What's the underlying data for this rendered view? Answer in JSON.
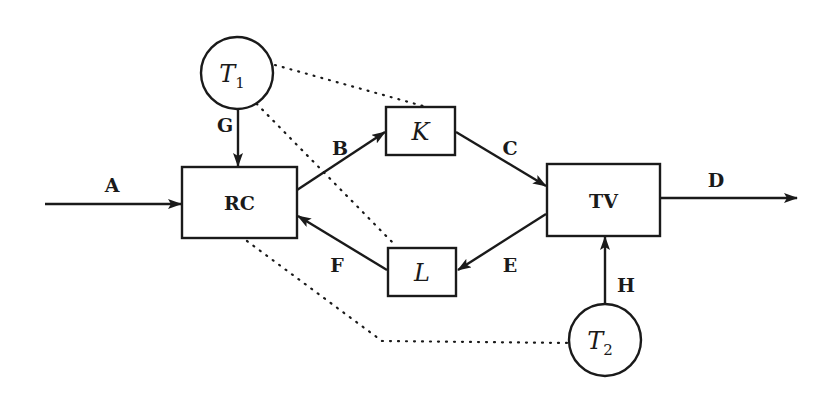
{
  "diagram": {
    "colors": {
      "stroke": "#1a1a1a",
      "background": "#ffffff"
    },
    "nodes": {
      "RC": {
        "label": "RC",
        "shape": "rectangle"
      },
      "TV": {
        "label": "TV",
        "shape": "rectangle"
      },
      "K": {
        "label": "K",
        "shape": "rectangle"
      },
      "L": {
        "label": "L",
        "shape": "rectangle"
      },
      "T1": {
        "label": "T",
        "subscript": "1",
        "shape": "circle"
      },
      "T2": {
        "label": "T",
        "subscript": "2",
        "shape": "circle"
      }
    },
    "edges": {
      "A": {
        "label": "A",
        "from": "input",
        "to": "RC",
        "style": "solid-arrow"
      },
      "B": {
        "label": "B",
        "from": "RC",
        "to": "K",
        "style": "solid-arrow"
      },
      "C": {
        "label": "C",
        "from": "K",
        "to": "TV",
        "style": "solid-arrow"
      },
      "D": {
        "label": "D",
        "from": "TV",
        "to": "output",
        "style": "solid-arrow"
      },
      "E": {
        "label": "E",
        "from": "TV",
        "to": "L",
        "style": "solid-arrow"
      },
      "F": {
        "label": "F",
        "from": "L",
        "to": "RC",
        "style": "solid-arrow"
      },
      "G": {
        "label": "G",
        "from": "T1",
        "to": "RC",
        "style": "solid-arrow"
      },
      "H": {
        "label": "H",
        "from": "T2",
        "to": "TV",
        "style": "solid-arrow"
      }
    },
    "dotted_links": [
      {
        "from": "T1",
        "to": "K"
      },
      {
        "from": "T1",
        "to": "L"
      },
      {
        "from": "RC",
        "to": "T2"
      }
    ]
  }
}
